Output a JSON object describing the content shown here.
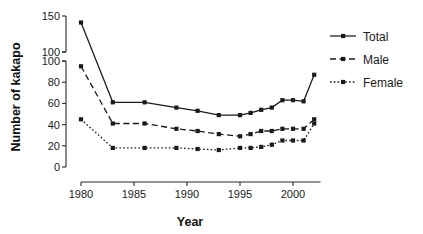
{
  "chart_data": {
    "type": "line",
    "title": "",
    "xlabel": "Year",
    "ylabel": "Number of kakapo",
    "xlim": [
      1979,
      2003
    ],
    "xticks": [
      1980,
      1985,
      1990,
      1995,
      2000
    ],
    "xticklabels": [
      "1980",
      "1985",
      "1990",
      "1995",
      "2000"
    ],
    "y_axis_broken": true,
    "y_segments": [
      {
        "name": "lower",
        "range": [
          0,
          100
        ],
        "ticks": [
          0,
          20,
          40,
          60,
          80,
          100
        ],
        "ticklabels": [
          "0",
          "20",
          "40",
          "60",
          "80",
          "100"
        ]
      },
      {
        "name": "upper",
        "range": [
          100,
          150
        ],
        "ticks": [
          100,
          150
        ],
        "ticklabels": [
          "100",
          "150"
        ]
      }
    ],
    "grid": false,
    "legend_position": "right",
    "series": [
      {
        "name": "Total",
        "linestyle": "solid",
        "marker": "square",
        "color": "#1a1a1a",
        "x": [
          1980,
          1983,
          1986,
          1989,
          1991,
          1993,
          1995,
          1996,
          1997,
          1998,
          1999,
          2000,
          2001,
          2002
        ],
        "values": [
          141,
          61,
          61,
          56,
          53,
          49,
          49,
          51,
          54,
          56,
          63,
          63,
          62,
          87
        ]
      },
      {
        "name": "Male",
        "linestyle": "dashed",
        "marker": "square",
        "color": "#1a1a1a",
        "x": [
          1980,
          1983,
          1986,
          1989,
          1991,
          1993,
          1995,
          1996,
          1997,
          1998,
          1999,
          2000,
          2001,
          2002
        ],
        "values": [
          95,
          41,
          41,
          36,
          34,
          31,
          29,
          31,
          34,
          34,
          36,
          36,
          36,
          45
        ]
      },
      {
        "name": "Female",
        "linestyle": "dotted",
        "marker": "square",
        "color": "#1a1a1a",
        "x": [
          1980,
          1983,
          1986,
          1989,
          1991,
          1993,
          1995,
          1996,
          1997,
          1998,
          1999,
          2000,
          2001,
          2002
        ],
        "values": [
          45,
          18,
          18,
          18,
          17,
          16,
          18,
          18,
          19,
          21,
          25,
          25,
          25,
          41
        ]
      }
    ]
  },
  "legend": {
    "items": [
      {
        "label": "Total"
      },
      {
        "label": "Male"
      },
      {
        "label": "Female"
      }
    ]
  },
  "labels": {
    "y_axis_title": "Number of kakapo",
    "x_axis_title": "Year"
  }
}
